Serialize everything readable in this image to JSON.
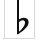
{
  "image": {
    "kind": "music-notation-glyph",
    "width_px": 41,
    "height_px": 51,
    "background_color": "#ffffff"
  },
  "glyph": {
    "name": "flat-accidental",
    "character": "♭",
    "label": "Flat",
    "unicode": "U+266D",
    "color": "#101010",
    "bounds": {
      "left_px": 17,
      "top_px": 0,
      "right_px": 28,
      "bottom_px": 34
    },
    "parts": {
      "stem": {
        "name": "stem",
        "top_px": 0,
        "bottom_px": 34,
        "x_px": 17,
        "width_px": 2
      },
      "bowl": {
        "name": "bowl",
        "top_px": 19,
        "bottom_px": 34,
        "left_px": 18,
        "right_px": 28
      }
    }
  },
  "frame": {
    "rule_color": "#d8d8d8",
    "left_rule_x_px": 4,
    "right_rule_x_px": 34,
    "bottom_rule_y_px": 38,
    "content_top_px": 0,
    "content_bottom_px": 38
  }
}
